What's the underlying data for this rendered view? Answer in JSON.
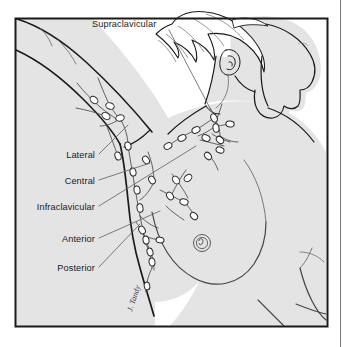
{
  "figure": {
    "artist_signature": "J. Tandy",
    "frame": {
      "border_color": "#1a1a1a",
      "page_edge_line_color": "#555555",
      "background_color": "#ffffff"
    },
    "colors": {
      "skin_fill": "#e4e4e4",
      "hair_fill": "#ffffff",
      "outline": "#1a1a1a",
      "interior_line": "#555555",
      "node_fill": "#ffffff",
      "node_outline": "#2a2a2a",
      "vessel_line": "#4a4a4a",
      "leader_line": "#666666",
      "label_text": "#1a1a1a"
    }
  },
  "labels": [
    {
      "id": "supraclavicular",
      "text": "Supraclavicular",
      "anchor": "start",
      "x": 92,
      "y": 27,
      "leader": {
        "x1": 169,
        "y1": 30,
        "x2": 212,
        "y2": 112
      }
    },
    {
      "id": "lateral",
      "text": "Lateral",
      "anchor": "end",
      "x": 95,
      "y": 158,
      "leader": {
        "x1": 99,
        "y1": 154,
        "x2": 128,
        "y2": 125
      }
    },
    {
      "id": "central",
      "text": "Central",
      "anchor": "end",
      "x": 95,
      "y": 184,
      "leader": {
        "x1": 99,
        "y1": 180,
        "x2": 150,
        "y2": 163
      }
    },
    {
      "id": "infraclavicular",
      "text": "Infraclavicular",
      "anchor": "end",
      "x": 95,
      "y": 210,
      "leader": {
        "x1": 99,
        "y1": 206,
        "x2": 196,
        "y2": 146
      }
    },
    {
      "id": "anterior",
      "text": "Anterior",
      "anchor": "end",
      "x": 95,
      "y": 242,
      "leader": {
        "x1": 99,
        "y1": 238,
        "x2": 160,
        "y2": 211
      }
    },
    {
      "id": "posterior",
      "text": "Posterior",
      "anchor": "end",
      "x": 95,
      "y": 271,
      "leader": {
        "x1": 99,
        "y1": 267,
        "x2": 140,
        "y2": 224
      }
    }
  ],
  "node_groups": [
    {
      "id": "lateral-group",
      "count": 6
    },
    {
      "id": "central-group",
      "count": 7
    },
    {
      "id": "supraclavicular-group",
      "count": 5
    },
    {
      "id": "infraclavicular-group",
      "count": 5
    },
    {
      "id": "anterior-group",
      "count": 5
    },
    {
      "id": "posterior-group",
      "count": 4
    }
  ]
}
